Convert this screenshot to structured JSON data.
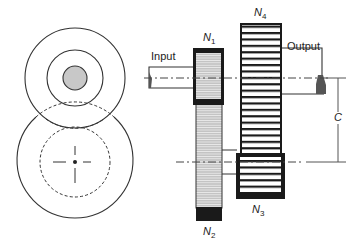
{
  "diagram": {
    "type": "compound gear train (reverted)",
    "labels": {
      "input": "Input",
      "output": "Output",
      "center_distance": "C",
      "gears": [
        {
          "id": "N1",
          "letter": "N",
          "sub": "1"
        },
        {
          "id": "N2",
          "letter": "N",
          "sub": "2"
        },
        {
          "id": "N3",
          "letter": "N",
          "sub": "3"
        },
        {
          "id": "N4",
          "letter": "N",
          "sub": "4"
        }
      ]
    },
    "colors": {
      "line": "#222222",
      "gear_fill_gray": "#bdbdbd",
      "hub_gray": "#c8c8c8",
      "gear_dark": "#1a1a1a"
    }
  }
}
